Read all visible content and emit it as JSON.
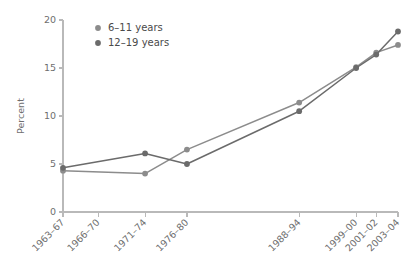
{
  "chart_data": {
    "type": "line",
    "title": "",
    "subtitle": "",
    "xlabel": "",
    "ylabel": "Percent",
    "ylim": [
      0,
      20
    ],
    "yticks": [
      0,
      5,
      10,
      15,
      20
    ],
    "ytick_labels": [
      "0",
      "5",
      "10",
      "15",
      "20"
    ],
    "grid": false,
    "legend_position": "top-left",
    "categories": [
      "1963–67",
      "1966–70",
      "1971–74",
      "1976–80",
      "1988–94",
      "1999–00",
      "2001–02",
      "2003–04"
    ],
    "category_positions": [
      0.0,
      0.105,
      0.245,
      0.37,
      0.705,
      0.875,
      0.935,
      1.0
    ],
    "series": [
      {
        "name": "6–11 years",
        "color": "#8c8c8c",
        "x": [
          "1963–67",
          "1971–74",
          "1976–80",
          "1988–94",
          "1999–00",
          "2001–02",
          "2003–04"
        ],
        "values": [
          4.3,
          4.0,
          6.5,
          11.4,
          15.1,
          16.6,
          17.4
        ]
      },
      {
        "name": "12–19 years",
        "color": "#6b6b6b",
        "x": [
          "1963–67",
          "1971–74",
          "1976–80",
          "1988–94",
          "1999–00",
          "2001–02",
          "2003–04"
        ],
        "values": [
          4.6,
          6.1,
          5.0,
          10.5,
          15.0,
          16.4,
          18.8
        ]
      }
    ]
  },
  "legend": {
    "items": [
      {
        "label": "6–11 years",
        "color": "#8c8c8c"
      },
      {
        "label": "12–19 years",
        "color": "#6b6b6b"
      }
    ]
  },
  "axes": {
    "y_title": "Percent",
    "y_tick_labels": [
      "20",
      "15",
      "10",
      "5",
      "0"
    ],
    "x_tick_labels": [
      "1963–67",
      "1966–70",
      "1971–74",
      "1976–80",
      "1988–94",
      "1999–00",
      "2001–02",
      "2003–04"
    ],
    "axis_color": "#b9b9b9",
    "label_color": "#6e6e6e"
  }
}
